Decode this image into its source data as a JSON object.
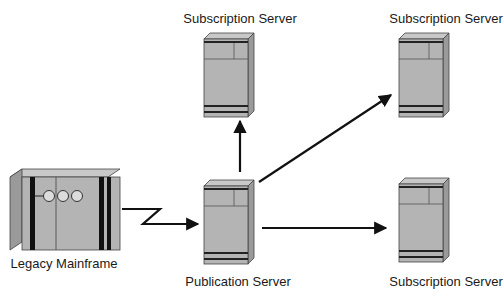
{
  "diagram": {
    "nodes": [
      {
        "id": "legacy",
        "label": "Legacy Mainframe",
        "icon": "mainframe-icon"
      },
      {
        "id": "publication",
        "label": "Publication Server",
        "icon": "server-tower-icon"
      },
      {
        "id": "sub_top_mid",
        "label": "Subscription Server",
        "icon": "server-tower-icon"
      },
      {
        "id": "sub_top_right",
        "label": "Subscription Server",
        "icon": "server-tower-icon"
      },
      {
        "id": "sub_bottom_right",
        "label": "Subscription Server",
        "icon": "server-tower-icon"
      }
    ],
    "edges": [
      {
        "from": "legacy",
        "to": "publication",
        "style": "zigzag-arrow"
      },
      {
        "from": "publication",
        "to": "sub_top_mid",
        "style": "arrow"
      },
      {
        "from": "publication",
        "to": "sub_top_right",
        "style": "arrow"
      },
      {
        "from": "publication",
        "to": "sub_bottom_right",
        "style": "arrow"
      }
    ],
    "colors": {
      "device_front": "#b4b4b4",
      "device_side": "#9a9a9a",
      "device_top": "#c8c8c8",
      "stroke": "#333333",
      "arrow": "#111111"
    }
  }
}
